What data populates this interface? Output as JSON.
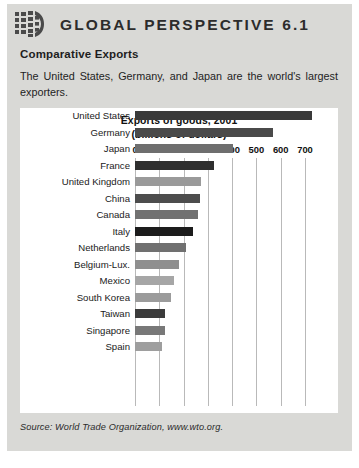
{
  "header": {
    "title": "GLOBAL PERSPECTIVE 6.1",
    "logo_icon": "globe-grid-icon"
  },
  "article": {
    "subtitle": "Comparative Exports",
    "intro": "The United States, Germany, and Japan are the world's largest exporters."
  },
  "source": {
    "text": "Source: World Trade Organization, www.wto.org."
  },
  "colors": {
    "box_background": "#d9d9d6",
    "chart_background": "#ffffff",
    "gridline": "#b9b9b9",
    "text": "#1e1e1e"
  },
  "chart_data": {
    "type": "bar",
    "orientation": "horizontal",
    "title": "Exports of goods, 2001",
    "subtitle": "(billions of dollars)",
    "xlabel": "",
    "ylabel": "",
    "xlim": [
      0,
      700
    ],
    "xticks": [
      0,
      100,
      200,
      300,
      400,
      500,
      600,
      700
    ],
    "xtick_labels": [
      "0",
      "100",
      "200",
      "300",
      "400",
      "500",
      "600",
      "700"
    ],
    "grid": true,
    "legend": "none",
    "categories": [
      "United States",
      "Germany",
      "Japan",
      "France",
      "United Kingdom",
      "China",
      "Canada",
      "Italy",
      "Netherlands",
      "Belgium-Lux.",
      "Mexico",
      "South Korea",
      "Taiwan",
      "Singapore",
      "Spain"
    ],
    "values": [
      730,
      570,
      405,
      325,
      270,
      266,
      260,
      240,
      210,
      180,
      159,
      150,
      123,
      122,
      110
    ],
    "bar_colors": [
      "#3a3a3a",
      "#4a4a4a",
      "#6e6e6e",
      "#2f2f2f",
      "#9a9a9a",
      "#4d4d4d",
      "#717171",
      "#1c1c1c",
      "#707070",
      "#8f8f8f",
      "#a6a6a6",
      "#9b9b9b",
      "#3b3b3b",
      "#787878",
      "#9e9e9e"
    ]
  }
}
